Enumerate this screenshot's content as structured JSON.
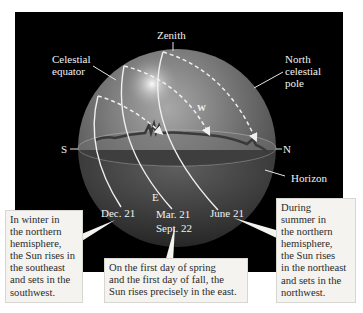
{
  "diagram": {
    "labels": {
      "zenith": "Zenith",
      "celestial_equator": "Celestial\nequator",
      "north_celestial_pole": "North\ncelestial\npole",
      "west": "W",
      "east": "E",
      "south": "S",
      "north": "N",
      "horizon": "Horizon",
      "dec21": "Dec. 21",
      "mar21": "Mar. 21",
      "sept22": "Sept. 22",
      "june21": "June 21"
    },
    "callouts": {
      "winter": "In winter in\nthe northern\nhemisphere,\nthe Sun rises in\nthe southeast\nand sets in the\nsouthwest.",
      "equinox": "On the first day of spring\nand the first day of fall, the\nSun rises precisely in the east.",
      "summer": "During\nsummer in\nthe northern\nhemisphere,\nthe Sun rises\nin the northeast\nand sets in the\nnorthwest."
    },
    "colors": {
      "background": "#000000",
      "sphere": "#6e6e6e",
      "callout_bg": "#f4f3ef",
      "path_line": "#f0f0f0"
    }
  }
}
